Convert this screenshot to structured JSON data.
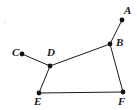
{
  "figure": {
    "canvas": {
      "width": 137,
      "height": 110,
      "background": "#ffffff"
    },
    "style": {
      "stroke_color": "#1a1a1a",
      "stroke_width": 1,
      "dot_color": "#111111",
      "dot_radius": 2.4,
      "label_color": "#1a1a1a"
    },
    "points": [
      {
        "id": "A",
        "label": "A",
        "x": 122,
        "y": 20,
        "label_x": 124,
        "label_y": 5
      },
      {
        "id": "B",
        "label": "B",
        "x": 110,
        "y": 44,
        "label_x": 116,
        "label_y": 37
      },
      {
        "id": "C",
        "label": "C",
        "x": 22,
        "y": 54,
        "label_x": 12,
        "label_y": 47
      },
      {
        "id": "D",
        "label": "D",
        "x": 50,
        "y": 66,
        "label_x": 47,
        "label_y": 47
      },
      {
        "id": "E",
        "label": "E",
        "x": 39,
        "y": 93,
        "label_x": 34,
        "label_y": 96
      },
      {
        "id": "F",
        "label": "F",
        "x": 123,
        "y": 92,
        "label_x": 118,
        "label_y": 96
      }
    ],
    "segments": [
      {
        "id": "AB",
        "from": "A",
        "to": "B"
      },
      {
        "id": "CD",
        "from": "C",
        "to": "D"
      },
      {
        "id": "DB",
        "from": "D",
        "to": "B"
      },
      {
        "id": "DE",
        "from": "D",
        "to": "E"
      },
      {
        "id": "BF",
        "from": "B",
        "to": "F"
      },
      {
        "id": "EF",
        "from": "E",
        "to": "F"
      }
    ],
    "artifacts": [
      {
        "id": "speck-1",
        "x": 4,
        "y": 21
      }
    ]
  }
}
